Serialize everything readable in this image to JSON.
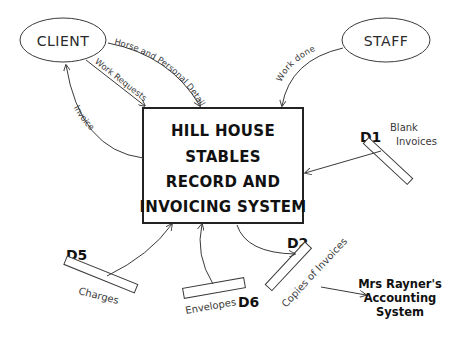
{
  "diagram": {
    "type": "data-flow-diagram",
    "process": {
      "lines": [
        "HILL HOUSE",
        "STABLES",
        "RECORD AND",
        "INVOICING SYSTEM"
      ]
    },
    "entities": {
      "client": "CLIENT",
      "staff": "STAFF"
    },
    "flows": {
      "horse_details": "Horse and Personal Details",
      "work_requests": "Work Requests",
      "invoice": "Invoice",
      "work_done": "Work done"
    },
    "stores": {
      "d1": {
        "id": "D1",
        "label_line1": "Blank",
        "label_line2": "Invoices"
      },
      "d2": {
        "id": "D2",
        "label": "Copies of Invoices"
      },
      "d5": {
        "id": "D5",
        "label": "Charges"
      },
      "d6": {
        "id": "D6",
        "label": "Envelopes"
      }
    },
    "external_system": {
      "lines": [
        "Mrs Rayner's",
        "Accounting",
        "System"
      ]
    },
    "colors": {
      "stroke": "#3a3a3a",
      "text": "#111111",
      "background": "#ffffff"
    }
  }
}
